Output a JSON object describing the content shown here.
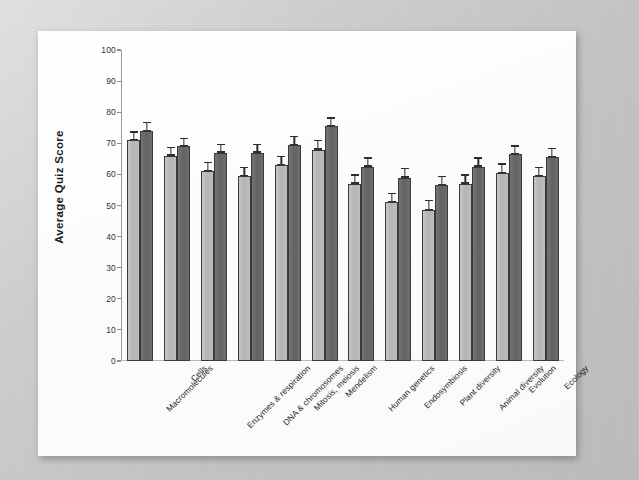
{
  "figure": {
    "background_color": "#c9c9c9",
    "panel_color": "#fdfdfd"
  },
  "chart_data": {
    "type": "bar",
    "title": "",
    "xlabel": "",
    "ylabel": "Average Quiz Score",
    "ylim": [
      0,
      100
    ],
    "ytick_labels": [
      "100",
      "90",
      "80",
      "70",
      "60",
      "50",
      "40",
      "30",
      "20",
      "10",
      "0"
    ],
    "ytick_values": [
      100,
      90,
      80,
      70,
      60,
      50,
      40,
      30,
      20,
      10,
      0
    ],
    "grid": false,
    "legend": "none",
    "error_bars": "standard error",
    "categories": [
      "Macromolecules",
      "Cells",
      "Enzymes & respiration",
      "DNA & chromosomes",
      "Mitosis, meiosis",
      "Mendelism",
      "Human genetics",
      "Endosymbiosis",
      "Plant diversity",
      "Animal diversity",
      "Evolution",
      "Ecology"
    ],
    "series": [
      {
        "name": "light",
        "color": "#bdbdbd",
        "values": [
          71,
          66,
          61,
          59.5,
          63,
          68,
          57,
          51,
          48.5,
          57,
          60.5,
          59.5
        ],
        "errors": [
          1.2,
          1.2,
          1.3,
          1.3,
          1.3,
          1.3,
          1.3,
          1.3,
          1.4,
          1.3,
          1.3,
          1.3
        ]
      },
      {
        "name": "dark",
        "color": "#6d6d6d",
        "values": [
          74,
          69,
          67,
          67,
          69.5,
          75.5,
          62.5,
          59,
          56.5,
          62.5,
          66.5,
          65.5
        ],
        "errors": [
          1.2,
          1.2,
          1.2,
          1.2,
          1.2,
          1.2,
          1.3,
          1.3,
          1.3,
          1.3,
          1.2,
          1.3
        ]
      }
    ]
  }
}
